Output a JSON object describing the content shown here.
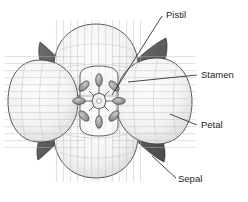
{
  "figure": {
    "type": "botanical-diagram",
    "background_color": "#ffffff",
    "line_color": "#3a3a3a",
    "petal_fill": "#f4f4f4",
    "sepal_fill": "#5d5d5d",
    "stamen_fill": "#9a9a9a",
    "pistil_fill": "#e8e8e8"
  },
  "labels": {
    "pistil": {
      "text": "Pistil",
      "x": 166,
      "y": 18,
      "leader_from_x": 112,
      "leader_from_y": 95,
      "leader_to_x": 162,
      "leader_to_y": 16
    },
    "stamen": {
      "text": "Stamen",
      "x": 201,
      "y": 78,
      "leader_from_x": 128,
      "leader_from_y": 82,
      "leader_to_x": 197,
      "leader_to_y": 75
    },
    "petal": {
      "text": "Petal",
      "x": 201,
      "y": 128,
      "leader_from_x": 170,
      "leader_from_y": 114,
      "leader_to_x": 197,
      "leader_to_y": 125
    },
    "sepal": {
      "text": "Sepal",
      "x": 178,
      "y": 182,
      "leader_from_x": 152,
      "leader_from_y": 156,
      "leader_to_x": 176,
      "leader_to_y": 178
    }
  },
  "parts": {
    "petals": [
      {
        "name": "petal-top",
        "cx": 96,
        "cy": 52
      },
      {
        "name": "petal-left",
        "cx": 52,
        "cy": 100
      },
      {
        "name": "petal-right",
        "cx": 142,
        "cy": 101
      },
      {
        "name": "petal-bottom",
        "cx": 96,
        "cy": 152
      }
    ],
    "sepals": [
      {
        "name": "sepal-top-left"
      },
      {
        "name": "sepal-top-right"
      },
      {
        "name": "sepal-bottom-left"
      },
      {
        "name": "sepal-bottom-right"
      }
    ],
    "stamen_count": 8,
    "pistil": {
      "cx": 99,
      "cy": 101
    }
  }
}
